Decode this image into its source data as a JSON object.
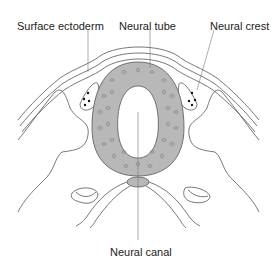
{
  "diagram": {
    "type": "anatomical cross-section",
    "labels": [
      {
        "id": "surface-ectoderm",
        "text": "Surface ectoderm"
      },
      {
        "id": "neural-tube",
        "text": "Neural tube"
      },
      {
        "id": "neural-crest",
        "text": "Neural crest"
      },
      {
        "id": "neural-canal",
        "text": "Neural canal"
      }
    ],
    "colors": {
      "neural_tube_fill": "#b8b8b8",
      "outline": "#555555",
      "leader_line": "#777777",
      "text": "#222222"
    }
  }
}
